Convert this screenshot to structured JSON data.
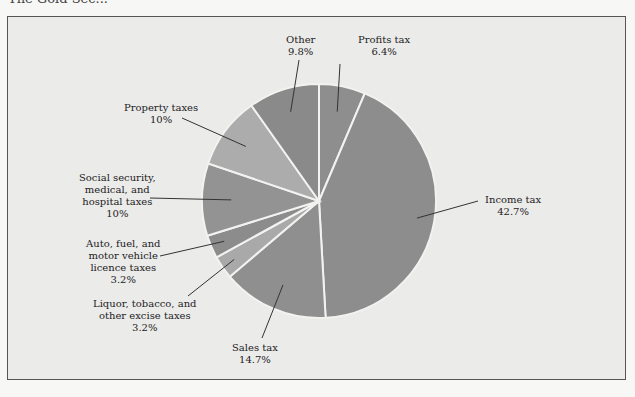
{
  "page": {
    "header_fragment": "The Gold Sec..."
  },
  "chart_data": {
    "type": "pie",
    "title": "",
    "start_angle_deg": 0,
    "direction": "clockwise",
    "slices": [
      {
        "label": "Profits tax",
        "value": 6.4,
        "value_label": "6.4%",
        "color": "#8e8e8e"
      },
      {
        "label": "Income tax",
        "value": 42.7,
        "value_label": "42.7%",
        "color": "#8d8d8d"
      },
      {
        "label": "Sales tax",
        "value": 14.7,
        "value_label": "14.7%",
        "color": "#8f8f8f"
      },
      {
        "label": "Liquor, tobacco, and other excise taxes",
        "value": 3.2,
        "value_label": "3.2%",
        "color": "#a9a9a9"
      },
      {
        "label": "Auto, fuel, and motor vehicle licence taxes",
        "value": 3.2,
        "value_label": "3.2%",
        "color": "#8c8c8c"
      },
      {
        "label": "Social security, medical, and hospital taxes",
        "value": 10,
        "value_label": "10%",
        "color": "#939393"
      },
      {
        "label": "Property taxes",
        "value": 10,
        "value_label": "10%",
        "color": "#acacac"
      },
      {
        "label": "Other",
        "value": 9.8,
        "value_label": "9.8%",
        "color": "#8a8a8a"
      }
    ],
    "legend": "none (callout labels)"
  },
  "labels": {
    "other": {
      "lines": [
        "Other",
        "9.8%"
      ]
    },
    "profits": {
      "lines": [
        "Profits tax",
        "6.4%"
      ]
    },
    "property": {
      "lines": [
        "Property taxes",
        "10%"
      ]
    },
    "social": {
      "lines": [
        "Social security,",
        "medical, and",
        "hospital taxes",
        "10%"
      ]
    },
    "income": {
      "lines": [
        "Income tax",
        "42.7%"
      ]
    },
    "auto": {
      "lines": [
        "Auto, fuel, and",
        "motor vehicle",
        "licence taxes",
        "3.2%"
      ]
    },
    "liquor": {
      "lines": [
        "Liquor, tobacco, and",
        "other excise taxes",
        "3.2%"
      ]
    },
    "sales": {
      "lines": [
        "Sales tax",
        "14.7%"
      ]
    }
  }
}
